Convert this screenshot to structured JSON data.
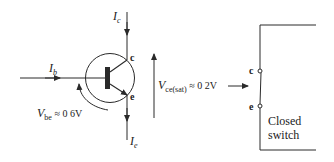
{
  "diagram": {
    "colors": {
      "stroke": "#2a2a2a",
      "background": "#ffffff"
    },
    "transistor": {
      "type": "NPN",
      "collector_label": "c",
      "emitter_label": "e",
      "collector_current": {
        "symbol": "I",
        "sub": "c"
      },
      "emitter_current": {
        "symbol": "I",
        "sub": "e"
      },
      "base_current": {
        "symbol": "I",
        "sub": "b"
      },
      "vbe": {
        "symbol": "V",
        "sub": "be",
        "value": " ≈ 0 6V"
      }
    },
    "vce_sat": {
      "symbol": "V",
      "sub": "ce(sat)",
      "value": " ≈ 0 2V"
    },
    "switch": {
      "terminal_top": "c",
      "terminal_bottom": "e",
      "label_line1": "Closed",
      "label_line2": "switch"
    }
  }
}
